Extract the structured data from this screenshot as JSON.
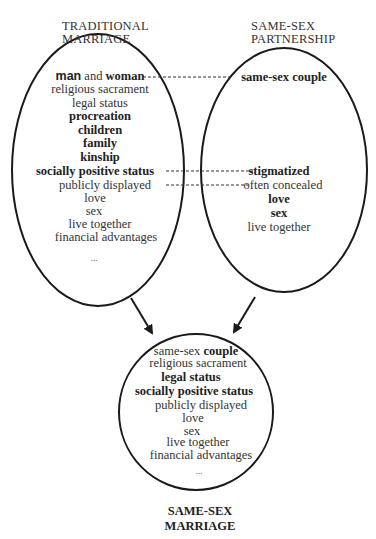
{
  "left": {
    "title_line1": "TRADITIONAL",
    "title_line2": "MARRIAGE",
    "first_a": "man",
    "first_b": " and ",
    "first_c": "woman",
    "items": [
      "religious sacrament",
      "legal status",
      "procreation",
      "children",
      "family",
      "kinship",
      "socially positive status",
      "publicly displayed",
      "love",
      "sex",
      "live together",
      "financial advantages",
      "..."
    ]
  },
  "right": {
    "title_line1": "SAME-SEX",
    "title_line2": "PARTNERSHIP",
    "items": [
      "same-sex couple",
      "stigmatized",
      "often concealed",
      "love",
      "sex",
      "live together"
    ]
  },
  "bottom": {
    "first_a": "same-sex ",
    "first_b": "couple",
    "items": [
      "religious sacrament",
      "legal status",
      "socially positive status",
      "publicly displayed",
      "love",
      "sex",
      "live together",
      "financial advantages",
      "..."
    ],
    "title_line1": "SAME-SEX",
    "title_line2": "MARRIAGE"
  }
}
